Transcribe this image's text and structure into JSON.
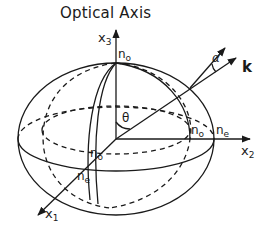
{
  "title": "Optical Axis",
  "axes": {
    "x1": {
      "base": "x",
      "sub": "1"
    },
    "x2": {
      "base": "x",
      "sub": "2"
    },
    "x3": {
      "base": "x",
      "sub": "3"
    }
  },
  "labels": {
    "no_top": {
      "base": "n",
      "sub": "o"
    },
    "no_right": {
      "base": "n",
      "sub": "o"
    },
    "ne_right": {
      "base": "n",
      "sub": "e"
    },
    "no_front": {
      "base": "n",
      "sub": "o"
    },
    "ne_front": {
      "base": "n",
      "sub": "e"
    },
    "theta": "θ",
    "alpha": "α",
    "k": "k"
  },
  "colors": {
    "line": "#1a1a1a",
    "background": "#ffffff"
  }
}
